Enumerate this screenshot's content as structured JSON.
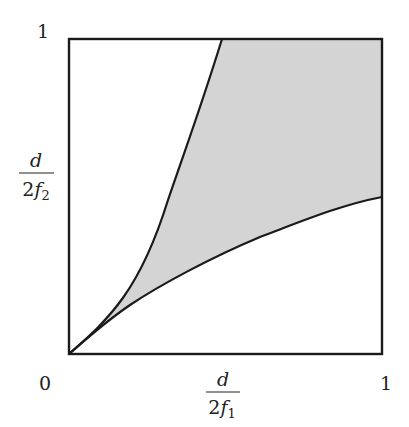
{
  "diagram": {
    "type": "region-plot",
    "x_axis": {
      "label_numerator": "d",
      "label_denominator_coeff": "2",
      "label_denominator_var": "f",
      "label_denominator_sub": "1",
      "min_tick": "0",
      "max_tick": "1"
    },
    "y_axis": {
      "label_numerator": "d",
      "label_denominator_coeff": "2",
      "label_denominator_var": "f",
      "label_denominator_sub": "2",
      "max_tick": "1"
    },
    "colors": {
      "frame": "#1a1a1a",
      "curve": "#1a1a1a",
      "shade": "#d4d4d4",
      "background": "#ffffff"
    },
    "curves": [
      {
        "name": "upper-boundary",
        "points": [
          [
            0,
            0
          ],
          [
            0.1,
            0.12
          ],
          [
            0.2,
            0.26
          ],
          [
            0.3,
            0.45
          ],
          [
            0.4,
            0.69
          ],
          [
            0.49,
            1.0
          ]
        ]
      },
      {
        "name": "lower-boundary",
        "points": [
          [
            0,
            0
          ],
          [
            0.1,
            0.085
          ],
          [
            0.2,
            0.16
          ],
          [
            0.4,
            0.29
          ],
          [
            0.6,
            0.39
          ],
          [
            0.8,
            0.46
          ],
          [
            1.0,
            0.5
          ]
        ]
      }
    ]
  }
}
